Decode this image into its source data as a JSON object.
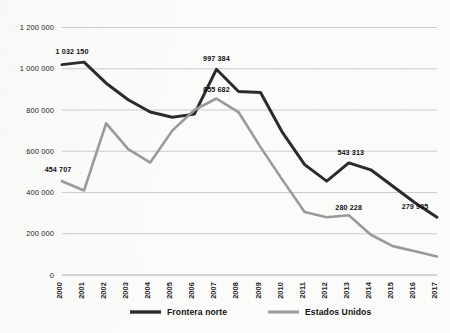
{
  "chart_data": {
    "type": "line",
    "title": "",
    "subtitle": "",
    "xlabel": "",
    "ylabel": "",
    "categories": [
      "2000",
      "2001",
      "2002",
      "2003",
      "2004",
      "2005",
      "2006",
      "2007",
      "2008",
      "2009",
      "2010",
      "2011",
      "2012",
      "2013",
      "2014",
      "2015",
      "2016",
      "2017"
    ],
    "ylim": [
      0,
      1200000
    ],
    "yticks": [
      0,
      200000,
      400000,
      600000,
      800000,
      1000000,
      1200000
    ],
    "ytick_labels": [
      "0",
      "200 000",
      "400 000",
      "600 000",
      "800 000",
      "1 000 000",
      "1 200 000"
    ],
    "grid": true,
    "legend_position": "bottom",
    "series": [
      {
        "name": "Frontera norte",
        "color": "#2b2b2b",
        "values": [
          1020000,
          1032150,
          930000,
          850000,
          790000,
          765000,
          780000,
          997384,
          890000,
          885000,
          690000,
          535000,
          455000,
          543313,
          510000,
          430000,
          350000,
          279905
        ]
      },
      {
        "name": "Estados Unidos",
        "color": "#9a9a9a",
        "values": [
          454707,
          410000,
          735000,
          610000,
          545000,
          700000,
          800000,
          855682,
          790000,
          620000,
          460000,
          305000,
          280228,
          290000,
          195000,
          140000,
          115000,
          90000
        ]
      }
    ],
    "point_labels": [
      {
        "series": "Estados Unidos",
        "category": "2000",
        "value": 454707,
        "text": "454 707",
        "dx": -4,
        "dy": -9
      },
      {
        "series": "Frontera norte",
        "category": "2001",
        "value": 1032150,
        "text": "1 032 150",
        "dx": -12,
        "dy": -8
      },
      {
        "series": "Frontera norte",
        "category": "2007",
        "value": 997384,
        "text": "997 384",
        "dx": 0,
        "dy": -8
      },
      {
        "series": "Estados Unidos",
        "category": "2007",
        "value": 855682,
        "text": "855 682",
        "dx": 0,
        "dy": -7
      },
      {
        "series": "Frontera norte",
        "category": "2013",
        "value": 543313,
        "text": "543 313",
        "dx": 2,
        "dy": -8
      },
      {
        "series": "Estados Unidos",
        "category": "2012",
        "value": 280228,
        "text": "280 228",
        "dx": 22,
        "dy": -7
      },
      {
        "series": "Frontera norte",
        "category": "2017",
        "value": 279905,
        "text": "279 905",
        "dx": -22,
        "dy": -8
      }
    ],
    "legend": [
      {
        "label": "Frontera norte",
        "color": "#2b2b2b"
      },
      {
        "label": "Estados Unidos",
        "color": "#9a9a9a"
      }
    ]
  }
}
